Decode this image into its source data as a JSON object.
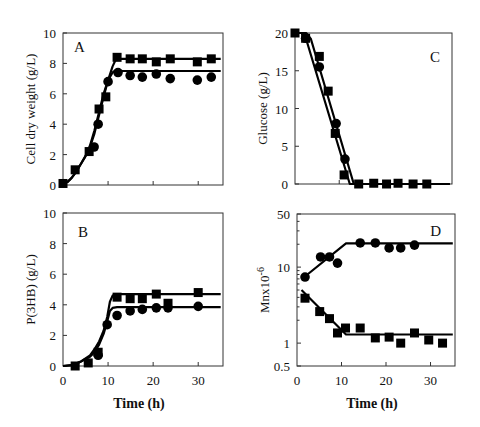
{
  "chart_data": [
    {
      "panel": "A",
      "type": "scatter",
      "title": "",
      "annotation": "A",
      "xlabel": "",
      "ylabel": "Cell dry weight (g/L)",
      "xlim": [
        0,
        35.5
      ],
      "ylim": [
        0,
        10
      ],
      "xticks": [
        0,
        10,
        20,
        30
      ],
      "xtick_labels": [],
      "yticks": [
        0,
        2,
        4,
        6,
        8,
        10
      ],
      "ytick_labels": [
        "0",
        "2",
        "4",
        "6",
        "8",
        "10"
      ],
      "yscale": "linear",
      "series": [
        {
          "name": "squares",
          "marker": "square",
          "points": [
            [
              0,
              0.1
            ],
            [
              2.7,
              1.0
            ],
            [
              5.8,
              2.2
            ],
            [
              8.0,
              5.0
            ],
            [
              9.5,
              5.8
            ],
            [
              12.0,
              8.4
            ],
            [
              14.9,
              8.3
            ],
            [
              17.6,
              8.3
            ],
            [
              20.7,
              8.1
            ],
            [
              23.8,
              8.3
            ],
            [
              29.8,
              8.1
            ],
            [
              32.9,
              8.3
            ]
          ],
          "fit": [
            [
              0,
              0.1
            ],
            [
              1,
              0.2
            ],
            [
              2,
              0.5
            ],
            [
              3,
              0.9
            ],
            [
              4,
              1.4
            ],
            [
              5,
              1.9
            ],
            [
              6,
              2.5
            ],
            [
              7,
              3.4
            ],
            [
              8,
              4.6
            ],
            [
              9,
              5.8
            ],
            [
              10,
              6.9
            ],
            [
              11,
              7.8
            ],
            [
              11.8,
              8.3
            ],
            [
              35,
              8.3
            ]
          ]
        },
        {
          "name": "circles",
          "marker": "circle",
          "points": [
            [
              6.9,
              2.5
            ],
            [
              7.8,
              4.0
            ],
            [
              10.0,
              6.8
            ],
            [
              12.2,
              7.4
            ],
            [
              14.9,
              7.2
            ],
            [
              17.6,
              7.1
            ],
            [
              20.7,
              7.3
            ],
            [
              23.8,
              7.0
            ],
            [
              29.8,
              6.9
            ],
            [
              32.9,
              7.1
            ]
          ],
          "fit": [
            [
              0,
              0.1
            ],
            [
              1,
              0.2
            ],
            [
              2,
              0.5
            ],
            [
              3,
              0.9
            ],
            [
              4,
              1.4
            ],
            [
              5,
              1.9
            ],
            [
              6,
              2.6
            ],
            [
              7,
              3.6
            ],
            [
              8,
              4.8
            ],
            [
              9,
              6.0
            ],
            [
              10,
              6.9
            ],
            [
              11,
              7.4
            ],
            [
              11.5,
              7.5
            ],
            [
              35,
              7.5
            ]
          ]
        }
      ]
    },
    {
      "panel": "C",
      "type": "scatter",
      "title": "",
      "annotation": "C",
      "xlabel": "",
      "ylabel": "Glucose (g/L)",
      "xlim": [
        0,
        35.5
      ],
      "ylim": [
        0,
        20
      ],
      "xticks": [
        0,
        10,
        20,
        30
      ],
      "xtick_labels": [],
      "yticks": [
        0,
        5,
        10,
        15,
        20
      ],
      "ytick_labels": [
        "0",
        "5",
        "10",
        "15",
        "20"
      ],
      "yscale": "linear",
      "series": [
        {
          "name": "squares",
          "marker": "square",
          "points": [
            [
              0,
              20
            ],
            [
              2.4,
              19.3
            ],
            [
              5.5,
              16.9
            ],
            [
              7.5,
              12.3
            ],
            [
              9.1,
              6.7
            ],
            [
              11.1,
              1.2
            ],
            [
              14.4,
              0
            ],
            [
              17.8,
              0.1
            ],
            [
              20.7,
              0
            ],
            [
              23.3,
              0.1
            ],
            [
              26.7,
              0
            ],
            [
              29.8,
              0
            ]
          ],
          "fit": [
            [
              0,
              20
            ],
            [
              1.5,
              20
            ],
            [
              2.5,
              19.2
            ],
            [
              12.4,
              0
            ],
            [
              35,
              0
            ]
          ]
        },
        {
          "name": "circles",
          "marker": "circle",
          "points": [
            [
              2.4,
              19.3
            ],
            [
              5.5,
              15.5
            ],
            [
              9.3,
              8.0
            ],
            [
              11.3,
              3.3
            ]
          ],
          "fit": [
            [
              0,
              20
            ],
            [
              2.5,
              20
            ],
            [
              3.6,
              19.2
            ],
            [
              13.3,
              0
            ],
            [
              35,
              0
            ]
          ]
        }
      ]
    },
    {
      "panel": "B",
      "type": "scatter",
      "title": "",
      "annotation": "B",
      "xlabel": "Time (h)",
      "ylabel": "P(3HB) (g/L)",
      "xlim": [
        0,
        35.5
      ],
      "ylim": [
        0,
        10
      ],
      "xticks": [
        0,
        10,
        20,
        30
      ],
      "xtick_labels": [
        "0",
        "10",
        "20",
        "30"
      ],
      "yticks": [
        0,
        2,
        4,
        6,
        8,
        10
      ],
      "ytick_labels": [
        "0",
        "2",
        "4",
        "6",
        "8",
        "10"
      ],
      "yscale": "linear",
      "series": [
        {
          "name": "squares",
          "marker": "square",
          "points": [
            [
              2.7,
              0
            ],
            [
              5.6,
              0.2
            ],
            [
              7.8,
              0.9
            ],
            [
              12.0,
              4.5
            ],
            [
              14.9,
              4.4
            ],
            [
              17.6,
              4.4
            ],
            [
              20.7,
              4.7
            ],
            [
              23.3,
              4.1
            ],
            [
              30.0,
              4.8
            ]
          ],
          "fit": [
            [
              0,
              0
            ],
            [
              2,
              0.05
            ],
            [
              4,
              0.3
            ],
            [
              6,
              0.7
            ],
            [
              7,
              1.1
            ],
            [
              8,
              1.6
            ],
            [
              9,
              2.3
            ],
            [
              9.8,
              3.2
            ],
            [
              10.4,
              4.2
            ],
            [
              11,
              4.6
            ],
            [
              12,
              4.7
            ],
            [
              35,
              4.7
            ]
          ]
        },
        {
          "name": "circles",
          "marker": "circle",
          "points": [
            [
              7.8,
              0.7
            ],
            [
              9.8,
              2.7
            ],
            [
              12.0,
              3.3
            ],
            [
              14.9,
              3.6
            ],
            [
              17.6,
              3.7
            ],
            [
              20.7,
              3.8
            ],
            [
              23.3,
              3.8
            ],
            [
              30.0,
              3.9
            ]
          ],
          "fit": [
            [
              0,
              0
            ],
            [
              2,
              0.05
            ],
            [
              4,
              0.3
            ],
            [
              6,
              0.6
            ],
            [
              7,
              0.9
            ],
            [
              8,
              1.4
            ],
            [
              9,
              2.1
            ],
            [
              9.8,
              2.9
            ],
            [
              10.4,
              3.6
            ],
            [
              11,
              3.8
            ],
            [
              12,
              3.85
            ],
            [
              35,
              3.85
            ]
          ]
        }
      ]
    },
    {
      "panel": "D",
      "type": "scatter",
      "title": "",
      "annotation": "D",
      "xlabel": "Time (h)",
      "ylabel": "Mnx10",
      "ylabel_superscript": "-6",
      "xlim": [
        0,
        35.5
      ],
      "ylim": [
        0.5,
        50
      ],
      "xticks": [
        0,
        10,
        20,
        30
      ],
      "xtick_labels": [
        "0",
        "10",
        "20",
        "30"
      ],
      "yticks": [
        0.5,
        1,
        10,
        50
      ],
      "ytick_labels": [
        "0.5",
        "1",
        "10",
        "50"
      ],
      "yscale": "log",
      "series": [
        {
          "name": "circles",
          "marker": "circle",
          "points": [
            [
              1.8,
              7.4
            ],
            [
              5.3,
              13.6
            ],
            [
              7.3,
              13.6
            ],
            [
              9.1,
              11.3
            ],
            [
              14.2,
              20.8
            ],
            [
              17.6,
              20.8
            ],
            [
              20.7,
              17.9
            ],
            [
              23.3,
              17.9
            ],
            [
              26.4,
              19.5
            ]
          ],
          "fit": [
            [
              1.5,
              7.3
            ],
            [
              11,
              20.5
            ],
            [
              35,
              20.5
            ]
          ]
        },
        {
          "name": "squares",
          "marker": "square",
          "points": [
            [
              1.8,
              3.9
            ],
            [
              5.1,
              2.6
            ],
            [
              7.3,
              2.1
            ],
            [
              9.1,
              1.36
            ],
            [
              10.9,
              1.58
            ],
            [
              14.2,
              1.58
            ],
            [
              17.6,
              1.17
            ],
            [
              20.7,
              1.2
            ],
            [
              23.3,
              1.0
            ],
            [
              26.4,
              1.36
            ],
            [
              29.6,
              1.1
            ],
            [
              32.7,
              1.0
            ]
          ],
          "fit": [
            [
              1,
              5.0
            ],
            [
              11,
              1.3
            ],
            [
              35,
              1.3
            ]
          ]
        }
      ]
    }
  ]
}
